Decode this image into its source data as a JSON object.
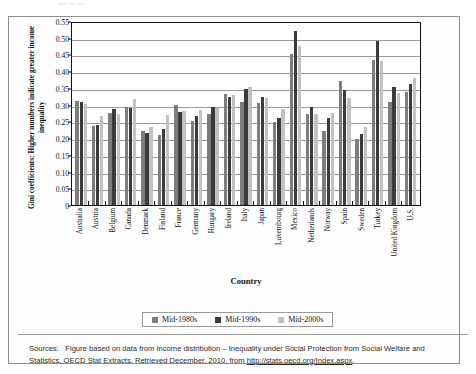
{
  "faint_top_text": "and the like",
  "chart_data": {
    "type": "bar",
    "title": "",
    "xlabel": "Country",
    "ylabel": "Gini coefficients: Higher numbers indicate greater income inequality",
    "ylim": [
      0,
      0.55
    ],
    "ytick_step": 0.05,
    "yticks": [
      "0.55",
      "0.50",
      "0.45",
      "0.40",
      "0.35",
      "0.30",
      "0.25",
      "0.20",
      "0.15",
      "0.10",
      "0.05",
      "0"
    ],
    "grid": true,
    "legend_position": "bottom",
    "categories": [
      "Australia",
      "Austria",
      "Belgium",
      "Canada",
      "Denmark",
      "Finland",
      "France",
      "Germany",
      "Hungary",
      "Ireland",
      "Italy",
      "Japan",
      "Luxembourg",
      "Mexico",
      "Netherlands",
      "Norway",
      "Spain",
      "Sweden",
      "Turkey",
      "United Kingdom",
      "U.S."
    ],
    "series": [
      {
        "name": "Mid-1980s",
        "color": "#7d7d7d",
        "values": [
          0.312,
          0.236,
          0.274,
          0.293,
          0.221,
          0.209,
          0.3,
          0.251,
          0.273,
          0.331,
          0.309,
          0.304,
          0.247,
          0.452,
          0.272,
          0.222,
          0.371,
          0.198,
          0.434,
          0.309,
          0.337
        ]
      },
      {
        "name": "Mid-1990s",
        "color": "#3b3b3b",
        "values": [
          0.309,
          0.238,
          0.287,
          0.289,
          0.215,
          0.228,
          0.277,
          0.266,
          0.294,
          0.324,
          0.348,
          0.323,
          0.259,
          0.519,
          0.292,
          0.261,
          0.343,
          0.211,
          0.49,
          0.354,
          0.361
        ]
      },
      {
        "name": "Mid-2000s",
        "color": "#c2c2c2",
        "values": [
          0.301,
          0.265,
          0.271,
          0.317,
          0.232,
          0.269,
          0.281,
          0.285,
          0.291,
          0.328,
          0.352,
          0.321,
          0.288,
          0.474,
          0.271,
          0.276,
          0.319,
          0.234,
          0.43,
          0.335,
          0.381
        ]
      }
    ]
  },
  "legend": {
    "items": [
      {
        "label": "Mid-1980s",
        "color": "#7d7d7d"
      },
      {
        "label": "Mid-1990s",
        "color": "#3b3b3b"
      },
      {
        "label": "Mid-2000s",
        "color": "#c2c2c2"
      }
    ]
  },
  "source": {
    "label": "Sources:",
    "text_before_url": "Figure based on data from Income distribution – Inequality under Social Protection from Social Welfare and Statistics, OECD Stat Extracts. Retrieved December, 2010, from",
    "url": "http://stats.oecd.org/Index.aspx",
    "trailing": "."
  }
}
